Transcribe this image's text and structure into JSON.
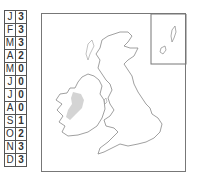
{
  "monthly_table": {
    "rows": [
      {
        "month": "J",
        "value": "3"
      },
      {
        "month": "F",
        "value": "3"
      },
      {
        "month": "M",
        "value": "3"
      },
      {
        "month": "A",
        "value": "2"
      },
      {
        "month": "M",
        "value": "0"
      },
      {
        "month": "J",
        "value": "0"
      },
      {
        "month": "J",
        "value": "0"
      },
      {
        "month": "A",
        "value": "0"
      },
      {
        "month": "S",
        "value": "1"
      },
      {
        "month": "O",
        "value": "2"
      },
      {
        "month": "N",
        "value": "3"
      },
      {
        "month": "D",
        "value": "3"
      }
    ]
  },
  "map": {
    "region": "British Isles",
    "inset": "Shetland and Orkney",
    "highlight_color": "#d4d4d4",
    "outline_color": "#777777",
    "highlighted_area": "Western Ireland"
  }
}
